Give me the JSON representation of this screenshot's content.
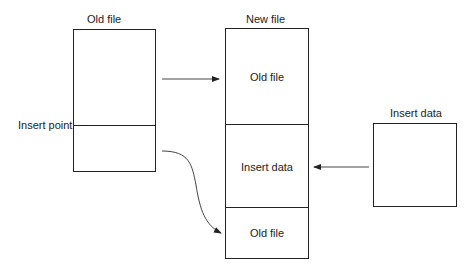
{
  "old_file": {
    "title": "Old file",
    "insert_point_label": "Insert point"
  },
  "new_file": {
    "title": "New file",
    "segments": [
      "Old file",
      "Insert data",
      "Old file"
    ]
  },
  "insert_data": {
    "title": "Insert data"
  },
  "arrows": [
    {
      "from": "old_file_top",
      "to": "new_file_segment_0",
      "shape": "straight"
    },
    {
      "from": "old_file_bottom",
      "to": "new_file_segment_2",
      "shape": "curved"
    },
    {
      "from": "insert_data",
      "to": "new_file_segment_1",
      "shape": "straight"
    }
  ]
}
